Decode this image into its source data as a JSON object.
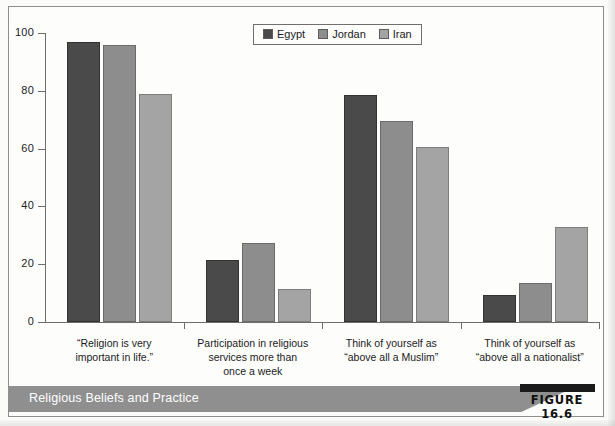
{
  "figure": {
    "caption": "Religious Beliefs and Practice",
    "label": "FIGURE 16.6"
  },
  "chart_data": {
    "type": "bar",
    "title": "Religious Beliefs and Practice",
    "xlabel": "",
    "ylabel": "",
    "ylim": [
      0,
      100
    ],
    "yticks": [
      0,
      20,
      40,
      60,
      80,
      100
    ],
    "ytick_labels": [
      "0",
      "20",
      "40",
      "60",
      "80",
      "100"
    ],
    "grid": false,
    "legend_position": "top-center",
    "categories": [
      "“Religion is very important in life.”",
      "Participation in religious services more than once a week",
      "Think of yourself as “above all a Muslim”",
      "Think of yourself as “above all a nationalist”"
    ],
    "category_lines": [
      [
        "“Religion is very",
        "important in life.”"
      ],
      [
        "Participation in religious",
        "services more than",
        "once a week"
      ],
      [
        "Think of yourself as",
        "“above all a Muslim”"
      ],
      [
        "Think of yourself as",
        "“above all a nationalist”"
      ]
    ],
    "series": [
      {
        "name": "Egypt",
        "color": "#4a4a4a",
        "values": [
          97,
          21.5,
          78.5,
          9.5
        ]
      },
      {
        "name": "Jordan",
        "color": "#8d8d8d",
        "values": [
          96,
          27.5,
          69.5,
          13.5
        ]
      },
      {
        "name": "Iran",
        "color": "#a4a4a4",
        "values": [
          79,
          11.5,
          60.5,
          33
        ]
      }
    ]
  }
}
